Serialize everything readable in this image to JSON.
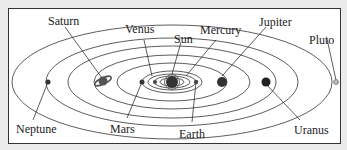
{
  "diagram": {
    "center": "Sun",
    "labels": {
      "saturn": "Saturn",
      "venus": "Venus",
      "sun": "Sun",
      "mercury": "Mercury",
      "jupiter": "Jupiter",
      "pluto": "Pluto",
      "neptune": "Neptune",
      "mars": "Mars",
      "earth": "Earth",
      "uranus": "Uranus"
    }
  }
}
